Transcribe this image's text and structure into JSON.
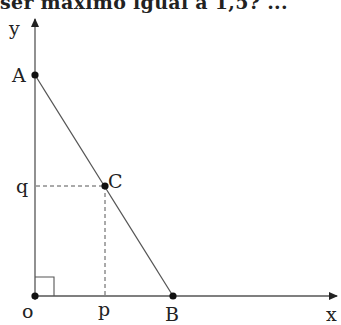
{
  "header": {
    "cutoff_text": "ser máximo igual a 1,5? ..."
  },
  "diagram": {
    "axes": {
      "x_label": "x",
      "y_label": "y",
      "origin_label": "o"
    },
    "points": {
      "A": {
        "label": "A"
      },
      "B": {
        "label": "B"
      },
      "C": {
        "label": "C"
      }
    },
    "projections": {
      "p_label": "p",
      "q_label": "q"
    },
    "colors": {
      "line": "#555555",
      "point": "#111111",
      "text": "#222222"
    }
  }
}
